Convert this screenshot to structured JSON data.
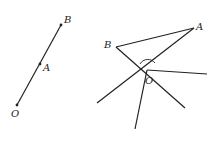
{
  "figure_left": {
    "points": [
      {
        "label": "O",
        "x": 17,
        "y": 105,
        "lx": 11,
        "ly": 117
      },
      {
        "label": "A",
        "x": 40,
        "y": 64,
        "lx": 43,
        "ly": 71
      },
      {
        "label": "B",
        "x": 61,
        "y": 25,
        "lx": 64,
        "ly": 23
      }
    ]
  },
  "figure_right": {
    "points": [
      {
        "label": "B",
        "x": 116,
        "y": 47,
        "lx": 104,
        "ly": 48
      },
      {
        "label": "A",
        "x": 194,
        "y": 28,
        "lx": 196,
        "ly": 30
      },
      {
        "label": "O",
        "x": 147,
        "y": 70,
        "lx": 145,
        "ly": 84
      }
    ]
  },
  "colors": {
    "line": "#222222",
    "background": "#ffffff"
  }
}
